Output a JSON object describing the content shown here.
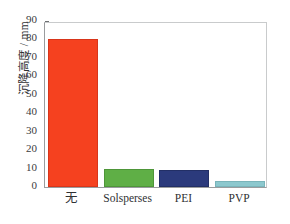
{
  "chart_data": {
    "type": "bar",
    "title": "",
    "xlabel": "",
    "ylabel": "沉降高度 / mm",
    "categories": [
      "无",
      "Solsperses",
      "PEI",
      "PVP"
    ],
    "values": [
      80,
      10,
      9,
      3
    ],
    "ylim": [
      0,
      90
    ],
    "yticks": [
      0,
      10,
      20,
      30,
      40,
      50,
      60,
      70,
      80,
      90
    ],
    "ytick_labels": [
      "0",
      "10",
      "20",
      "30",
      "40",
      "50",
      "60",
      "70",
      "80",
      "90"
    ],
    "grid": false,
    "legend": null,
    "legend_position": "none",
    "bar_colors": [
      "#F5411F",
      "#5FAF46",
      "#2B3A7C",
      "#8CC8CE"
    ],
    "bar_edge_colors": [
      "#D8351A",
      "#4E9639",
      "#222F66",
      "#79B4BA"
    ],
    "axis_color": "#9A9C9E",
    "tick_color": "#6E7072",
    "text_color": "#2F3133",
    "background": "#FFFFFF"
  }
}
